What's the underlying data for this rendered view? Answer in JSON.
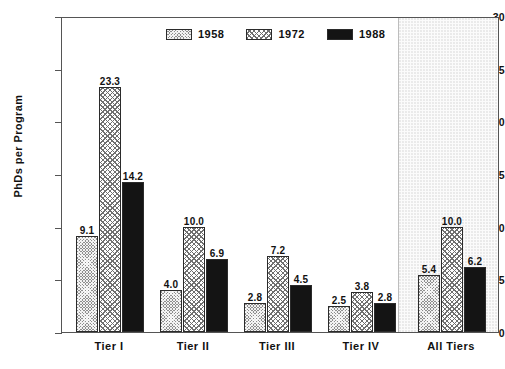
{
  "chart_data": {
    "type": "bar",
    "title": "",
    "xlabel": "",
    "ylabel": "PhDs per Program",
    "categories": [
      "Tier I",
      "Tier II",
      "Tier III",
      "Tier IV",
      "All Tiers"
    ],
    "series": [
      {
        "name": "1958",
        "values": [
          9.1,
          4.0,
          2.8,
          2.5,
          5.4
        ],
        "color": "#8e8e8e",
        "pattern": "cross-hatch-dense"
      },
      {
        "name": "1972",
        "values": [
          23.3,
          10.0,
          7.2,
          3.8,
          10.0
        ],
        "color": "#ffffff",
        "pattern": "cross-hatch-light"
      },
      {
        "name": "1988",
        "values": [
          14.2,
          6.9,
          4.5,
          2.8,
          6.2
        ],
        "color": "#141414",
        "pattern": "solid"
      }
    ],
    "data_labels": [
      [
        "9.1",
        "23.3",
        "14.2"
      ],
      [
        "4.0",
        "10.0",
        "6.9"
      ],
      [
        "2.8",
        "7.2",
        "4.5"
      ],
      [
        "2.5",
        "3.8",
        "2.8"
      ],
      [
        "5.4",
        "10.0",
        "6.2"
      ]
    ],
    "ylim": [
      0,
      30
    ],
    "yticks": [
      0,
      5,
      10,
      15,
      20,
      25,
      30
    ],
    "ytick_labels": [
      "0",
      "5",
      "10",
      "15",
      "20",
      "25",
      "30"
    ],
    "grid": false,
    "legend_position": "top-center",
    "highlight_region": {
      "category": "All Tiers",
      "shading": "stippled-light-gray"
    }
  },
  "legend": {
    "entries": [
      {
        "label": "1958"
      },
      {
        "label": "1972"
      },
      {
        "label": "1988"
      }
    ]
  },
  "axes": {
    "y_title": "PhDs per Program"
  }
}
